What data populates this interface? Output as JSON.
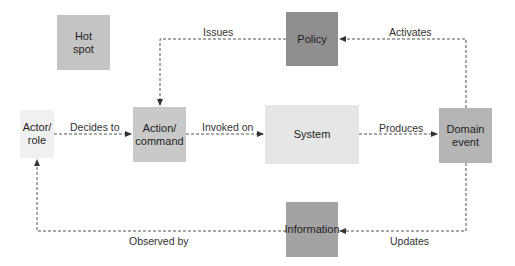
{
  "diagram": {
    "type": "event-storming-legend",
    "nodes": [
      {
        "id": "hotspot",
        "label": "Hot\nspot",
        "line1": "Hot",
        "line2": "spot",
        "color": "#c4c4c4"
      },
      {
        "id": "policy",
        "label": "Policy",
        "color": "#8f8f8f"
      },
      {
        "id": "actor",
        "label": "Actor/\nrole",
        "line1": "Actor/",
        "line2": "role",
        "color": "#f0f0f0"
      },
      {
        "id": "action",
        "label": "Action/\ncommand",
        "line1": "Action/",
        "line2": "command",
        "color": "#c9c9c9"
      },
      {
        "id": "system",
        "label": "System",
        "color": "#e6e6e6"
      },
      {
        "id": "domain_event",
        "label": "Domain\nevent",
        "line1": "Domain",
        "line2": "event",
        "color": "#b5b5b5"
      },
      {
        "id": "information",
        "label": "Information",
        "color": "#a3a3a3"
      }
    ],
    "edges": [
      {
        "from": "actor",
        "to": "action",
        "label": "Decides to"
      },
      {
        "from": "action",
        "to": "system",
        "label": "Invoked on"
      },
      {
        "from": "system",
        "to": "domain_event",
        "label": "Produces"
      },
      {
        "from": "domain_event",
        "to": "policy",
        "label": "Activates"
      },
      {
        "from": "policy",
        "to": "action",
        "label": "Issues"
      },
      {
        "from": "domain_event",
        "to": "information",
        "label": "Updates"
      },
      {
        "from": "information",
        "to": "actor",
        "label": "Observed by"
      }
    ]
  }
}
